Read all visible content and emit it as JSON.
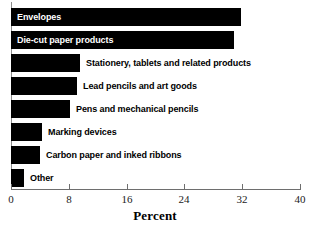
{
  "chart_data": {
    "type": "bar",
    "orientation": "horizontal",
    "title": "",
    "xlabel": "Percent",
    "ylabel": "",
    "xlim": [
      0,
      40
    ],
    "xticks": [
      0,
      8,
      16,
      24,
      32,
      40
    ],
    "grid": false,
    "legend": null,
    "categories": [
      "Envelopes",
      "Die-cut paper products",
      "Stationery, tablets and related products",
      "Lead pencils and art goods",
      "Pens and mechanical pencils",
      "Marking devices",
      "Carbon paper and inked ribbons",
      "Other"
    ],
    "values": [
      31.8,
      30.9,
      9.6,
      9.1,
      8.2,
      4.3,
      4.0,
      1.8
    ],
    "bars": [
      {
        "label": "Envelopes",
        "value": 31.8,
        "label_placement": "inside"
      },
      {
        "label": "Die-cut paper products",
        "value": 30.9,
        "label_placement": "inside"
      },
      {
        "label": "Stationery, tablets and related products",
        "value": 9.6,
        "label_placement": "outside"
      },
      {
        "label": "Lead pencils and art goods",
        "value": 9.1,
        "label_placement": "outside"
      },
      {
        "label": "Pens and mechanical pencils",
        "value": 8.2,
        "label_placement": "outside"
      },
      {
        "label": "Marking devices",
        "value": 4.3,
        "label_placement": "outside"
      },
      {
        "label": "Carbon paper and inked ribbons",
        "value": 4.0,
        "label_placement": "outside"
      },
      {
        "label": "Other",
        "value": 1.8,
        "label_placement": "outside"
      }
    ],
    "bar_color": "#000000",
    "axis_color": "#6e6e6e",
    "background_color": "#ffffff"
  }
}
